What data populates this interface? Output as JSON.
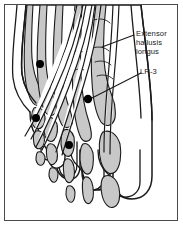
{
  "figure": {
    "type": "anatomical-illustration",
    "frame": {
      "border_color": "#4a4a4a",
      "background": "#ffffff"
    },
    "palette": {
      "outline": "#1a1a1a",
      "bone_fill": "#c8c8c8",
      "bone_fill_light": "#d6d6d6",
      "skin_fill": "#ffffff",
      "point_marker": "#000000",
      "leader_line": "#1a1a1a",
      "text": "#1a1a1a"
    }
  },
  "labels": [
    {
      "id": "extensor-hallucis-longus",
      "lines": [
        "Extensor",
        "hallusis",
        "longus"
      ],
      "text": "Extensor hallusis longus",
      "x": 136,
      "y": 29,
      "leader": {
        "from_x": 134,
        "from_y": 35,
        "to_x": 102,
        "to_y": 47
      }
    },
    {
      "id": "lr-3",
      "lines": [
        "LR-3"
      ],
      "text": "LR-3",
      "x": 140,
      "y": 67,
      "leader": {
        "from_x": 141,
        "from_y": 73,
        "to_x": 92,
        "to_y": 98
      }
    }
  ],
  "points": [
    {
      "id": "point-lr3",
      "label": "LR-3",
      "cx": 88,
      "cy": 99,
      "r": 4.2
    },
    {
      "id": "point-upper",
      "label": "point-upper",
      "cx": 40,
      "cy": 64,
      "r": 4.0
    },
    {
      "id": "point-middle",
      "label": "point-middle",
      "cx": 36,
      "cy": 118,
      "r": 4.0
    },
    {
      "id": "point-lower",
      "label": "point-lower",
      "cx": 69,
      "cy": 145,
      "r": 4.0
    }
  ]
}
